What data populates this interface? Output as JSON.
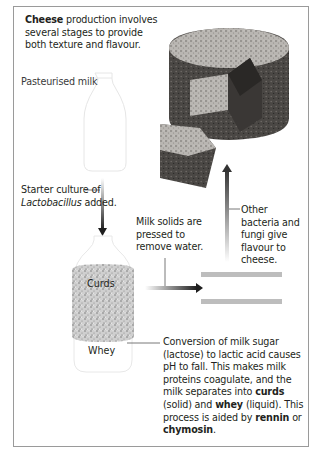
{
  "intro": {
    "bold": "Cheese",
    "rest": " production involves several stages to provide both texture and flavour."
  },
  "labels": {
    "pasteurised_milk": "Pasteurised milk",
    "starter_culture": {
      "pre": "Starter culture of ",
      "italic": "Lactobacillus",
      "post": " added."
    },
    "milk_solids": "Milk solids are pressed to remove water.",
    "other_bacteria": "Other bacteria and fungi give flavour to cheese.",
    "curds": "Curds",
    "whey": "Whey",
    "conversion": {
      "t1": "Conversion of milk sugar (lactose) to lactic acid causes pH to fall. This makes milk proteins coagulate, and the milk separates into ",
      "b1": "curds",
      "t2": " (solid) and ",
      "b2": "whey",
      "t3": " (liquid). This process is aided by ",
      "b3": "rennin",
      "t4": " or ",
      "b4": "chymosin",
      "t5": "."
    }
  },
  "icons": [
    "milk-bottle-icon",
    "curds-whey-bottle-icon",
    "cheese-wheel-image",
    "press-plates-icon",
    "arrow-down-icon",
    "arrow-right-icon",
    "arrow-up-icon"
  ],
  "colors": {
    "border": "#9a9a9a",
    "text": "#231f20",
    "arrow_dark": "#2b2b2b",
    "press": "#b8b8b8"
  }
}
